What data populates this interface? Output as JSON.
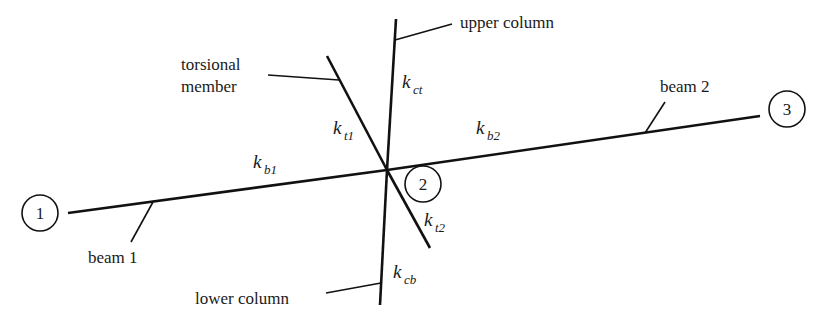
{
  "diagram": {
    "type": "structural-joint-stiffness",
    "colors": {
      "line": "#111111",
      "background": "#ffffff"
    },
    "joint": {
      "x": 387,
      "y": 170
    },
    "members": [
      {
        "id": "beam1",
        "name": "beam 1",
        "stiffness_symbol": "k",
        "stiffness_sub": "b1"
      },
      {
        "id": "beam2",
        "name": "beam 2",
        "stiffness_symbol": "k",
        "stiffness_sub": "b2"
      },
      {
        "id": "upper_column",
        "name": "upper column",
        "stiffness_symbol": "k",
        "stiffness_sub": "ct"
      },
      {
        "id": "lower_column",
        "name": "lower column",
        "stiffness_symbol": "k",
        "stiffness_sub": "cb"
      },
      {
        "id": "torsional_upper",
        "name": "torsional member",
        "stiffness_symbol": "k",
        "stiffness_sub": "t1"
      },
      {
        "id": "torsional_lower",
        "name": "",
        "stiffness_symbol": "k",
        "stiffness_sub": "t2"
      }
    ],
    "labels": {
      "upper_column": "upper column",
      "lower_column": "lower column",
      "beam1": "beam 1",
      "beam2": "beam 2",
      "torsional_line1": "torsional",
      "torsional_line2": "member"
    },
    "stiffness": {
      "k": "k",
      "b1": "b1",
      "b2": "b2",
      "ct": "ct",
      "cb": "cb",
      "t1": "t1",
      "t2": "t2"
    },
    "nodes": [
      {
        "id": "1",
        "label": "1"
      },
      {
        "id": "2",
        "label": "2"
      },
      {
        "id": "3",
        "label": "3"
      }
    ]
  }
}
